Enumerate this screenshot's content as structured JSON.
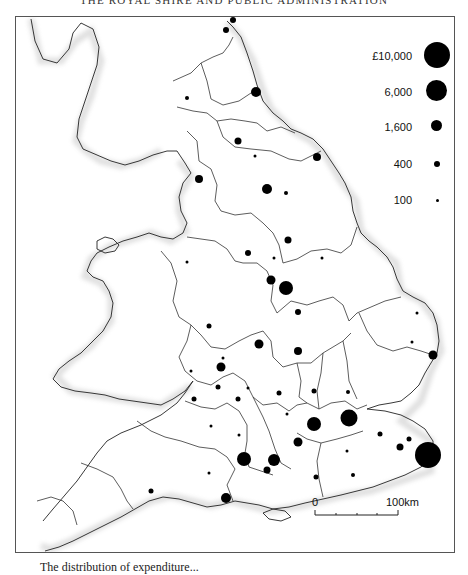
{
  "running_head": "THE ROYAL SHIRE AND PUBLIC ADMINISTRATION",
  "map": {
    "title": "Distribution by county (England and Wales)",
    "legend": {
      "currency_symbol": "£",
      "items": [
        {
          "label": "£10,000",
          "diameter": 26
        },
        {
          "label": "6,000",
          "diameter": 21
        },
        {
          "label": "1,600",
          "diameter": 12
        },
        {
          "label": "400",
          "diameter": 7
        },
        {
          "label": "100",
          "diameter": 3
        }
      ]
    },
    "scale_bar": {
      "start_label": "0",
      "end_label": "100km"
    },
    "symbols": [
      {
        "x": 232,
        "y": 19,
        "d": 6
      },
      {
        "x": 225,
        "y": 29,
        "d": 6
      },
      {
        "x": 255,
        "y": 91,
        "d": 10
      },
      {
        "x": 186,
        "y": 97,
        "d": 4
      },
      {
        "x": 237,
        "y": 140,
        "d": 7
      },
      {
        "x": 254,
        "y": 155,
        "d": 3
      },
      {
        "x": 316,
        "y": 156,
        "d": 8
      },
      {
        "x": 198,
        "y": 178,
        "d": 8
      },
      {
        "x": 266,
        "y": 188,
        "d": 10
      },
      {
        "x": 285,
        "y": 192,
        "d": 4
      },
      {
        "x": 287,
        "y": 239,
        "d": 7
      },
      {
        "x": 247,
        "y": 252,
        "d": 6
      },
      {
        "x": 186,
        "y": 261,
        "d": 3
      },
      {
        "x": 273,
        "y": 257,
        "d": 3
      },
      {
        "x": 321,
        "y": 257,
        "d": 3
      },
      {
        "x": 270,
        "y": 279,
        "d": 9
      },
      {
        "x": 285,
        "y": 287,
        "d": 14
      },
      {
        "x": 297,
        "y": 311,
        "d": 6
      },
      {
        "x": 208,
        "y": 325,
        "d": 5
      },
      {
        "x": 258,
        "y": 343,
        "d": 9
      },
      {
        "x": 297,
        "y": 350,
        "d": 8
      },
      {
        "x": 416,
        "y": 312,
        "d": 3
      },
      {
        "x": 411,
        "y": 341,
        "d": 3
      },
      {
        "x": 432,
        "y": 354,
        "d": 9
      },
      {
        "x": 222,
        "y": 357,
        "d": 3
      },
      {
        "x": 190,
        "y": 370,
        "d": 3
      },
      {
        "x": 220,
        "y": 366,
        "d": 9
      },
      {
        "x": 217,
        "y": 386,
        "d": 5
      },
      {
        "x": 278,
        "y": 392,
        "d": 5
      },
      {
        "x": 313,
        "y": 390,
        "d": 5
      },
      {
        "x": 347,
        "y": 391,
        "d": 4
      },
      {
        "x": 193,
        "y": 398,
        "d": 5
      },
      {
        "x": 247,
        "y": 387,
        "d": 3
      },
      {
        "x": 237,
        "y": 398,
        "d": 5
      },
      {
        "x": 312,
        "y": 420,
        "d": 5
      },
      {
        "x": 286,
        "y": 413,
        "d": 3
      },
      {
        "x": 348,
        "y": 417,
        "d": 17
      },
      {
        "x": 313,
        "y": 423,
        "d": 14
      },
      {
        "x": 297,
        "y": 441,
        "d": 9
      },
      {
        "x": 210,
        "y": 425,
        "d": 3
      },
      {
        "x": 238,
        "y": 434,
        "d": 3
      },
      {
        "x": 379,
        "y": 433,
        "d": 5
      },
      {
        "x": 408,
        "y": 438,
        "d": 5
      },
      {
        "x": 399,
        "y": 446,
        "d": 7
      },
      {
        "x": 427,
        "y": 454,
        "d": 26
      },
      {
        "x": 243,
        "y": 458,
        "d": 14
      },
      {
        "x": 273,
        "y": 459,
        "d": 12
      },
      {
        "x": 266,
        "y": 469,
        "d": 7
      },
      {
        "x": 208,
        "y": 472,
        "d": 3
      },
      {
        "x": 315,
        "y": 476,
        "d": 5
      },
      {
        "x": 150,
        "y": 490,
        "d": 5
      },
      {
        "x": 225,
        "y": 497,
        "d": 10
      },
      {
        "x": 346,
        "y": 450,
        "d": 3
      },
      {
        "x": 352,
        "y": 474,
        "d": 4
      }
    ]
  },
  "caption": "The distribution of expenditure..."
}
